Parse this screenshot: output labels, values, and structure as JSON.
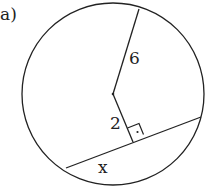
{
  "part_label": "a)",
  "labels": {
    "radius": "6",
    "distance": "2",
    "chord_half": "x"
  },
  "colors": {
    "stroke": "#222222",
    "background": "#ffffff"
  },
  "geometry": {
    "center": [
      113,
      93
    ],
    "radius": 90,
    "radius_end": [
      139,
      9
    ],
    "chord": [
      [
        66,
        168
      ],
      [
        201,
        117
      ]
    ],
    "foot": [
      133,
      142
    ]
  }
}
